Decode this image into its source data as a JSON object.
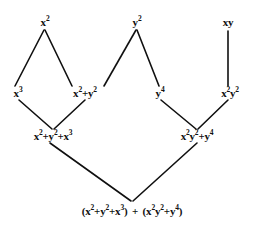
{
  "diagram": {
    "type": "expression-dag",
    "background_color": "#ffffff",
    "line_color": "#101010",
    "text_color": "#101010",
    "nodes": [
      {
        "id": "n-x2",
        "label": "x2",
        "text": "x²",
        "row": "top",
        "x": 45,
        "y": 22
      },
      {
        "id": "n-y2",
        "label": "y2",
        "text": "y²",
        "row": "top",
        "x": 137,
        "y": 22
      },
      {
        "id": "n-xy",
        "label": "xy",
        "text": "xy",
        "row": "top",
        "x": 228,
        "y": 22
      },
      {
        "id": "n-x3",
        "label": "x3",
        "text": "x³",
        "row": "middle",
        "x": 18,
        "y": 93
      },
      {
        "id": "n-x2py2",
        "label": "x2+y2",
        "text": "x²+y²",
        "row": "middle",
        "x": 85,
        "y": 93
      },
      {
        "id": "n-y4",
        "label": "y4",
        "text": "y⁴",
        "row": "middle",
        "x": 160,
        "y": 93
      },
      {
        "id": "n-x2y2",
        "label": "x2y2",
        "text": "x²y²",
        "row": "middle",
        "x": 230,
        "y": 93
      },
      {
        "id": "n-x2py2px3",
        "label": "x2+y2+x3",
        "text": "x²+y²+x³",
        "row": "lower",
        "x": 53,
        "y": 136
      },
      {
        "id": "n-x2y2py4",
        "label": "x2y2+y4",
        "text": "x²y²+y⁴",
        "row": "lower",
        "x": 197,
        "y": 136
      },
      {
        "id": "n-sum",
        "label": "sum",
        "text": "(x²+y²+x³) + (x²y²+y⁴)",
        "row": "bottom",
        "x": 132,
        "y": 211
      }
    ],
    "edges": [
      {
        "from": "n-x2",
        "to": "n-x3",
        "x1": 44,
        "y1": 30,
        "x2": 15,
        "y2": 86
      },
      {
        "from": "n-x2",
        "to": "n-x2py2",
        "x1": 45,
        "y1": 30,
        "x2": 72,
        "y2": 86
      },
      {
        "from": "n-y2",
        "to": "n-x2py2",
        "x1": 136,
        "y1": 30,
        "x2": 104,
        "y2": 86
      },
      {
        "from": "n-y2",
        "to": "n-y4",
        "x1": 137,
        "y1": 30,
        "x2": 159,
        "y2": 86
      },
      {
        "from": "n-xy",
        "to": "n-x2y2",
        "x1": 228,
        "y1": 31,
        "x2": 228,
        "y2": 86
      },
      {
        "from": "n-x3",
        "to": "n-x2py2px3",
        "x1": 19,
        "y1": 100,
        "x2": 52,
        "y2": 129
      },
      {
        "from": "n-x2py2",
        "to": "n-x2py2px3",
        "x1": 85,
        "y1": 100,
        "x2": 54,
        "y2": 129
      },
      {
        "from": "n-y4",
        "to": "n-x2y2py4",
        "x1": 161,
        "y1": 100,
        "x2": 196,
        "y2": 129
      },
      {
        "from": "n-x2y2",
        "to": "n-x2y2py4",
        "x1": 228,
        "y1": 100,
        "x2": 198,
        "y2": 129
      },
      {
        "from": "n-x2py2px3",
        "to": "n-sum",
        "x1": 50,
        "y1": 143,
        "x2": 131,
        "y2": 201
      },
      {
        "from": "n-x2y2py4",
        "to": "n-sum",
        "x1": 197,
        "y1": 143,
        "x2": 133,
        "y2": 201
      }
    ]
  },
  "chart_data": {
    "type": "diagram",
    "nodes": [
      "x²",
      "y²",
      "xy",
      "x³",
      "x²+y²",
      "y⁴",
      "x²y²",
      "x²+y²+x³",
      "x²y²+y⁴",
      "(x²+y²+x³) + (x²y²+y⁴)"
    ],
    "levels": [
      {
        "name": "top",
        "labels": [
          "x²",
          "y²",
          "xy"
        ]
      },
      {
        "name": "middle",
        "labels": [
          "x³",
          "x²+y²",
          "y⁴",
          "x²y²"
        ]
      },
      {
        "name": "lower",
        "labels": [
          "x²+y²+x³",
          "x²y²+y⁴"
        ]
      },
      {
        "name": "bottom",
        "labels": [
          "(x²+y²+x³) + (x²y²+y⁴)"
        ]
      }
    ],
    "connections": [
      [
        "x²",
        "x³"
      ],
      [
        "x²",
        "x²+y²"
      ],
      [
        "y²",
        "x²+y²"
      ],
      [
        "y²",
        "y⁴"
      ],
      [
        "xy",
        "x²y²"
      ],
      [
        "x³",
        "x²+y²+x³"
      ],
      [
        "x²+y²",
        "x²+y²+x³"
      ],
      [
        "y⁴",
        "x²y²+y⁴"
      ],
      [
        "x²y²",
        "x²y²+y⁴"
      ],
      [
        "x²+y²+x³",
        "(x²+y²+x³) + (x²y²+y⁴)"
      ],
      [
        "x²y²+y⁴",
        "(x²+y²+x³) + (x²y²+y⁴)"
      ]
    ]
  }
}
